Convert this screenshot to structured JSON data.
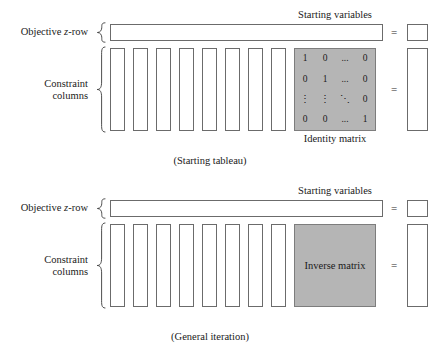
{
  "figure": {
    "panels": [
      {
        "id": "starting",
        "caption": "(Starting tableau)",
        "labels": {
          "objective_prefix": "Objective ",
          "objective_italic": "z",
          "objective_suffix": "-row",
          "constraint_line1": "Constraint",
          "constraint_line2": "columns"
        },
        "annotations": {
          "starting_variables": "Starting variables",
          "matrix_caption": "Identity matrix"
        },
        "equals": [
          "=",
          "="
        ],
        "constraint_column_count": 8,
        "matrix": {
          "kind": "identity",
          "rows": [
            [
              "1",
              "0",
              "...",
              "0"
            ],
            [
              "0",
              "1",
              "...",
              "0"
            ],
            [
              "⋮",
              "⋮",
              "⋱",
              "0"
            ],
            [
              "0",
              "0",
              "...",
              "1"
            ]
          ]
        }
      },
      {
        "id": "general",
        "caption": "(General iteration)",
        "labels": {
          "objective_prefix": "Objective ",
          "objective_italic": "z",
          "objective_suffix": "-row",
          "constraint_line1": "Constraint",
          "constraint_line2": "columns"
        },
        "annotations": {
          "starting_variables": "Starting variables",
          "matrix_caption": ""
        },
        "equals": [
          "=",
          "="
        ],
        "constraint_column_count": 8,
        "matrix": {
          "kind": "inverse",
          "center_text": "Inverse matrix"
        }
      }
    ],
    "colors": {
      "matrix_fill": "#b5b5b5",
      "box_stroke": "#6b6b6b",
      "text": "#1a1a1a",
      "background": "#ffffff"
    }
  }
}
